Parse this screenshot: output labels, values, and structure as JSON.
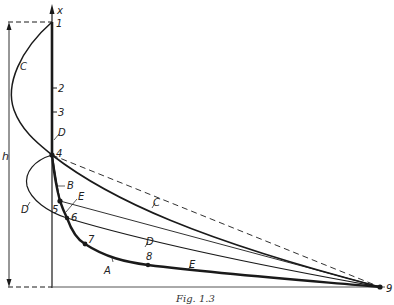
{
  "figure": {
    "caption": "Fig. 1.3",
    "axis_label": "x",
    "height_label": "h",
    "colors": {
      "ink": "#1a1a1a",
      "background": "#ffffff"
    }
  },
  "points": [
    {
      "id": "1",
      "label": "1"
    },
    {
      "id": "2",
      "label": "2"
    },
    {
      "id": "3",
      "label": "3"
    },
    {
      "id": "4",
      "label": "4"
    },
    {
      "id": "5",
      "label": "5"
    },
    {
      "id": "6",
      "label": "6"
    },
    {
      "id": "7",
      "label": "7"
    },
    {
      "id": "8",
      "label": "8"
    },
    {
      "id": "9",
      "label": "9"
    }
  ],
  "curves": {
    "A": "A",
    "B": "B",
    "C_upper": "C",
    "C_lower": "C",
    "D_upper": "D",
    "D_loop": "D",
    "D_lower": "D",
    "E_upper": "E",
    "E_lower": "E"
  }
}
